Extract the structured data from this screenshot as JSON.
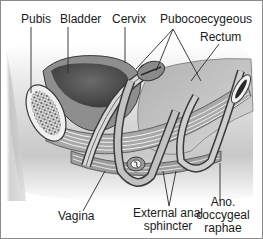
{
  "diagram": {
    "type": "anatomical-sagittal-section",
    "labels": {
      "pubis": "Pubis",
      "bladder": "Bladder",
      "cervix": "Cervix",
      "pubococcygeous": "Pubocoecygeous",
      "rectum": "Rectum",
      "vagina": "Vagina",
      "external_anal_sphincter_line1": "External anal",
      "external_anal_sphincter_line2": "sphincter",
      "ano_coccygeal_line1": "Ano.",
      "ano_coccygeal_line2": "coccygeal",
      "ano_coccygeal_line3": "raphae"
    },
    "colors": {
      "border": "#8a8a8a",
      "tissue_light": "#d4d4d4",
      "tissue_mid": "#9a9a9a",
      "tissue_dark": "#5a5a5a",
      "outline": "#3a3a3a",
      "leader_line": "#2a2a2a",
      "text": "#1a1a1a"
    }
  }
}
